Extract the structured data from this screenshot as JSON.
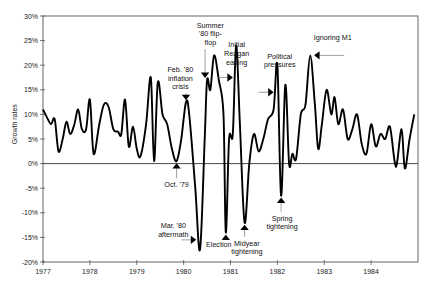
{
  "chart_data": {
    "type": "line",
    "title": "",
    "xlabel": "",
    "ylabel": "Growth rates",
    "xlim": [
      1977,
      1985
    ],
    "ylim": [
      -20,
      30
    ],
    "grid": false,
    "legend": null,
    "x_ticks": [
      "1977",
      "1978",
      "1979",
      "1980",
      "1981",
      "1982",
      "1983",
      "1984"
    ],
    "y_ticks": [
      "30%",
      "25%",
      "20%",
      "15%",
      "10%",
      "5%",
      "0%",
      "-5%",
      "-10%",
      "-15%",
      "-20%"
    ],
    "series": [
      {
        "name": "Money growth rate",
        "x": [
          1977.0,
          1977.08,
          1977.17,
          1977.25,
          1977.33,
          1977.42,
          1977.5,
          1977.58,
          1977.67,
          1977.75,
          1977.83,
          1977.92,
          1978.0,
          1978.08,
          1978.2,
          1978.3,
          1978.4,
          1978.5,
          1978.6,
          1978.67,
          1978.75,
          1978.83,
          1978.92,
          1979.0,
          1979.08,
          1979.2,
          1979.3,
          1979.37,
          1979.45,
          1979.55,
          1979.65,
          1979.75,
          1979.85,
          1979.95,
          1980.05,
          1980.12,
          1980.25,
          1980.35,
          1980.45,
          1980.5,
          1980.57,
          1980.65,
          1980.75,
          1980.85,
          1980.9,
          1980.97,
          1981.05,
          1981.12,
          1981.2,
          1981.3,
          1981.4,
          1981.5,
          1981.6,
          1981.7,
          1981.8,
          1981.92,
          1982.0,
          1982.08,
          1982.17,
          1982.25,
          1982.32,
          1982.4,
          1982.5,
          1982.6,
          1982.7,
          1982.8,
          1982.87,
          1982.95,
          1983.05,
          1983.15,
          1983.22,
          1983.3,
          1983.4,
          1983.5,
          1983.6,
          1983.7,
          1983.8,
          1983.9,
          1984.0,
          1984.1,
          1984.2,
          1984.3,
          1984.4,
          1984.5,
          1984.55,
          1984.65,
          1984.72,
          1984.82,
          1984.92
        ],
        "values": [
          11,
          9.5,
          8,
          9,
          2.5,
          5,
          8.5,
          6,
          8,
          11,
          7,
          7,
          13,
          2,
          8,
          12,
          11.5,
          7,
          6.5,
          6,
          13,
          3.5,
          7.5,
          3,
          1.5,
          8,
          17.5,
          0.5,
          16.5,
          10,
          8,
          3,
          0.5,
          5,
          12.5,
          10,
          -5,
          -17.5,
          5,
          17,
          15,
          22,
          17,
          10,
          -14,
          5,
          6,
          24,
          8,
          -12,
          0,
          6,
          2.5,
          5,
          9,
          11,
          20,
          -6.5,
          16,
          0,
          2,
          1,
          10,
          12,
          22,
          12,
          3,
          8,
          15,
          10,
          13.5,
          8,
          11,
          5,
          7,
          10,
          4,
          2,
          8,
          3.5,
          6,
          5,
          7.5,
          0.5,
          0,
          7,
          -1,
          5,
          10
        ]
      }
    ],
    "annotations": [
      {
        "id": "feb80",
        "lines": [
          "Feb. '80",
          "inflation",
          "crisis"
        ],
        "arrow": "down",
        "x": 1980.05,
        "y": 12.5
      },
      {
        "id": "summer80",
        "lines": [
          "Summer",
          "'80 flip-",
          "flop"
        ],
        "arrow": "down",
        "x": 1980.5,
        "y": 17
      },
      {
        "id": "reagan",
        "lines": [
          "Initial",
          "Reagan",
          "easing"
        ],
        "arrow": "right",
        "x": 1981.05,
        "y": 16
      },
      {
        "id": "political",
        "lines": [
          "Political",
          "pressures"
        ],
        "arrow": "right",
        "x": 1981.95,
        "y": 15
      },
      {
        "id": "m1",
        "lines": [
          "Ignoring M1"
        ],
        "arrow": "left",
        "x": 1982.72,
        "y": 22
      },
      {
        "id": "oct79",
        "lines": [
          "Oct. '79"
        ],
        "arrow": "up",
        "x": 1979.85,
        "y": 0.5
      },
      {
        "id": "mar80",
        "lines": [
          "Mar. '80",
          "aftermath"
        ],
        "arrow": "right",
        "x": 1980.3,
        "y": -15.5
      },
      {
        "id": "election",
        "lines": [
          "Election"
        ],
        "arrow": "up",
        "x": 1980.9,
        "y": -14
      },
      {
        "id": "midyear",
        "lines": [
          "Midyear",
          "tightening"
        ],
        "arrow": "up",
        "x": 1981.3,
        "y": -12
      },
      {
        "id": "spring",
        "lines": [
          "Spring",
          "tightening"
        ],
        "arrow": "up",
        "x": 1982.08,
        "y": -6.5
      }
    ]
  }
}
